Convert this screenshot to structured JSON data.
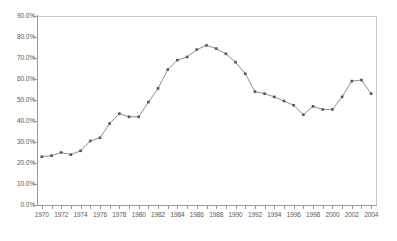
{
  "chart_data": {
    "type": "line",
    "title": "",
    "subtitle": "",
    "xlabel": "",
    "ylabel": "",
    "grid": false,
    "legend": "none",
    "xlim": [
      1969.5,
      2004.5
    ],
    "ylim": [
      0,
      90
    ],
    "y_tick_labels": [
      "90.0%",
      "80.0%",
      "70.0%",
      "60.0%",
      "50.0%",
      "40.0%",
      "30.0%",
      "20.0%",
      "10.0%",
      "0.0%"
    ],
    "y_tick_values": [
      90,
      80,
      70,
      60,
      50,
      40,
      30,
      20,
      10,
      0
    ],
    "x_tick_labels": [
      "1970",
      "1972",
      "1974",
      "1976",
      "1978",
      "1980",
      "1982",
      "1984",
      "1986",
      "1988",
      "1990",
      "1992",
      "1994",
      "1996",
      "1998",
      "2000",
      "2002",
      "2004"
    ],
    "x_tick_values": [
      1970,
      1972,
      1974,
      1976,
      1978,
      1980,
      1982,
      1984,
      1986,
      1988,
      1990,
      1992,
      1994,
      1996,
      1998,
      2000,
      2002,
      2004
    ],
    "x": [
      1970,
      1971,
      1972,
      1973,
      1974,
      1975,
      1976,
      1977,
      1978,
      1979,
      1980,
      1981,
      1982,
      1983,
      1984,
      1985,
      1986,
      1987,
      1988,
      1989,
      1990,
      1991,
      1992,
      1993,
      1994,
      1995,
      1996,
      1997,
      1998,
      1999,
      2000,
      2001,
      2002,
      2003,
      2004
    ],
    "values": [
      23.0,
      23.5,
      25.0,
      24.0,
      25.8,
      30.5,
      32.0,
      38.8,
      43.5,
      42.0,
      42.0,
      49.0,
      55.5,
      64.5,
      69.0,
      70.5,
      74.0,
      76.0,
      74.5,
      72.0,
      68.0,
      62.5,
      54.0,
      53.0,
      51.5,
      49.5,
      47.5,
      43.0,
      47.0,
      45.5,
      45.5,
      51.5,
      59.0,
      59.5,
      53.0
    ],
    "series_name": "series-1",
    "series_color": "#808080",
    "marker_color": "#555555",
    "marker_shape": "square",
    "axis_color": "#9a9a9a",
    "frame_color": "#c8c8c8",
    "background": "#ffffff",
    "tick_label_color": "#595959"
  }
}
